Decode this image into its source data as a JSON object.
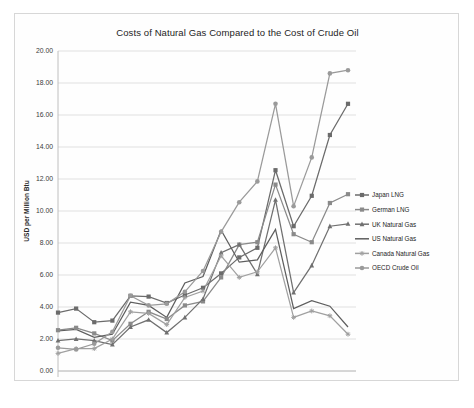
{
  "chart_data": {
    "type": "line",
    "title": "Costs of Natural Gas Compared to the Cost of Crude Oil",
    "xlabel": "",
    "ylabel": "USD per Million Btu",
    "x": [
      1996,
      1997,
      1998,
      1999,
      2000,
      2001,
      2002,
      2003,
      2004,
      2005,
      2006,
      2007,
      2008,
      2009,
      2010,
      2011,
      2012
    ],
    "xtick_labels": [
      "1996",
      "1997",
      "1998",
      "1999",
      "2000",
      "2001",
      "2002",
      "2003",
      "2004",
      "2005",
      "2006",
      "2007",
      "2008",
      "2009",
      "2010",
      "2011",
      "2012"
    ],
    "ylim": [
      0.0,
      20.0
    ],
    "ytick_values": [
      0.0,
      2.0,
      4.0,
      6.0,
      8.0,
      10.0,
      12.0,
      14.0,
      16.0,
      18.0,
      20.0
    ],
    "ytick_labels": [
      "0.00",
      "2.00",
      "4.00",
      "6.00",
      "8.00",
      "10.00",
      "12.00",
      "14.00",
      "16.00",
      "18.00",
      "20.00"
    ],
    "grid": true,
    "legend_position": "right",
    "series": [
      {
        "name": "Japan LNG",
        "color": "#6b6b6b",
        "marker": "square",
        "values": [
          3.65,
          3.9,
          3.05,
          3.15,
          4.7,
          4.65,
          4.25,
          4.75,
          5.2,
          6.1,
          7.1,
          7.7,
          12.55,
          9.05,
          10.95,
          14.75,
          16.7
        ]
      },
      {
        "name": "German LNG",
        "color": "#8a8a8a",
        "marker": "square",
        "values": [
          2.55,
          2.7,
          2.35,
          1.9,
          2.95,
          3.7,
          3.25,
          4.1,
          4.35,
          5.85,
          7.9,
          8.05,
          11.65,
          8.55,
          8.05,
          10.5,
          11.05
        ]
      },
      {
        "name": "UK Natural Gas",
        "color": "#707070",
        "marker": "triangle",
        "values": [
          1.9,
          2.0,
          1.9,
          1.65,
          2.75,
          3.2,
          2.4,
          3.35,
          4.5,
          7.4,
          7.9,
          6.05,
          10.7,
          4.9,
          6.6,
          9.05,
          9.2
        ]
      },
      {
        "name": "US Natural Gas",
        "color": "#5e5e5e",
        "marker": "none",
        "values": [
          2.5,
          2.6,
          2.1,
          2.3,
          4.3,
          4.1,
          3.35,
          5.5,
          5.9,
          8.8,
          6.8,
          6.95,
          8.85,
          3.9,
          4.4,
          4.05,
          2.75
        ]
      },
      {
        "name": "Canada Natural Gas",
        "color": "#a0a0a0",
        "marker": "star",
        "values": [
          1.1,
          1.4,
          1.4,
          2.0,
          3.7,
          3.6,
          2.9,
          4.6,
          5.0,
          7.2,
          5.85,
          6.2,
          7.7,
          3.35,
          3.75,
          3.45,
          2.3
        ]
      },
      {
        "name": "OECD Crude Oil",
        "color": "#9a9a9a",
        "marker": "circle",
        "values": [
          1.45,
          1.35,
          1.7,
          2.45,
          4.7,
          4.1,
          4.2,
          4.95,
          6.25,
          8.7,
          10.55,
          11.85,
          16.7,
          10.3,
          13.35,
          18.6,
          18.8
        ]
      }
    ]
  }
}
